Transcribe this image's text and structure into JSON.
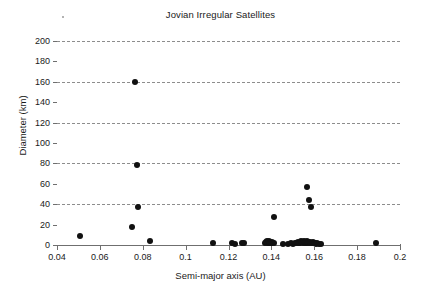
{
  "figure": {
    "width": 441,
    "height": 296,
    "background": "#ffffff",
    "marker_color": "#111111",
    "axis_color": "#6f6f6f",
    "grid_color": "#8d8d8d",
    "text_color": "#1a1a1a",
    "speck_label": "stray-speck"
  },
  "chart_data": {
    "type": "scatter",
    "title": "Jovian Irregular Satellites",
    "xlabel": "Semi-major axis (AU)",
    "ylabel": "Diameter (km)",
    "xlim": [
      0.04,
      0.2
    ],
    "ylim": [
      0,
      200
    ],
    "xticks": [
      0.04,
      0.06,
      0.08,
      0.1,
      0.12,
      0.14,
      0.16,
      0.18,
      0.2
    ],
    "xtick_labels": [
      "0.04",
      "0.06",
      "0.08",
      "0.1",
      "0.12",
      "0.14",
      "0.16",
      "0.18",
      "0.2"
    ],
    "yticks": [
      0,
      20,
      40,
      60,
      80,
      100,
      120,
      140,
      160,
      180,
      200
    ],
    "ytick_labels": [
      "0",
      "20",
      "40",
      "60",
      "80",
      "100",
      "120",
      "140",
      "160",
      "180",
      "200"
    ],
    "gridlines_y": [
      40,
      80,
      120,
      160,
      200
    ],
    "grid": "horizontal-dashed",
    "legend": "none",
    "marker_size_px": 6,
    "series": [
      {
        "name": "Jovian irregular satellites",
        "points": [
          [
            0.0505,
            9.0
          ],
          [
            0.075,
            17.5
          ],
          [
            0.0765,
            160.0
          ],
          [
            0.0775,
            78.0
          ],
          [
            0.0778,
            37.0
          ],
          [
            0.0835,
            3.5
          ],
          [
            0.1128,
            2.0
          ],
          [
            0.1215,
            1.5
          ],
          [
            0.1228,
            1.0
          ],
          [
            0.1262,
            1.5
          ],
          [
            0.1272,
            1.5
          ],
          [
            0.137,
            1.5
          ],
          [
            0.1375,
            2.5
          ],
          [
            0.1378,
            4.0
          ],
          [
            0.138,
            3.0
          ],
          [
            0.1382,
            2.0
          ],
          [
            0.1384,
            1.5
          ],
          [
            0.1388,
            2.5
          ],
          [
            0.139,
            4.0
          ],
          [
            0.1392,
            3.0
          ],
          [
            0.1395,
            1.5
          ],
          [
            0.1398,
            2.0
          ],
          [
            0.1402,
            2.5
          ],
          [
            0.1405,
            1.5
          ],
          [
            0.141,
            27.5
          ],
          [
            0.1412,
            2.0
          ],
          [
            0.1455,
            1.0
          ],
          [
            0.1478,
            1.0
          ],
          [
            0.149,
            1.5
          ],
          [
            0.15,
            1.0
          ],
          [
            0.1512,
            2.0
          ],
          [
            0.1518,
            1.5
          ],
          [
            0.1522,
            3.0
          ],
          [
            0.1528,
            2.0
          ],
          [
            0.1535,
            1.5
          ],
          [
            0.154,
            3.5
          ],
          [
            0.1545,
            2.5
          ],
          [
            0.1548,
            1.5
          ],
          [
            0.1552,
            4.0
          ],
          [
            0.1555,
            2.0
          ],
          [
            0.1558,
            3.0
          ],
          [
            0.156,
            1.5
          ],
          [
            0.1562,
            2.5
          ],
          [
            0.1565,
            57.0
          ],
          [
            0.1568,
            4.0
          ],
          [
            0.157,
            2.0
          ],
          [
            0.1572,
            3.0
          ],
          [
            0.1575,
            44.5
          ],
          [
            0.1578,
            1.5
          ],
          [
            0.1582,
            2.5
          ],
          [
            0.1585,
            37.5
          ],
          [
            0.1588,
            2.0
          ],
          [
            0.1592,
            3.0
          ],
          [
            0.1598,
            1.5
          ],
          [
            0.1602,
            2.0
          ],
          [
            0.1608,
            1.0
          ],
          [
            0.1615,
            1.5
          ],
          [
            0.1622,
            1.0
          ],
          [
            0.163,
            1.0
          ],
          [
            0.189,
            1.5
          ]
        ]
      }
    ]
  }
}
